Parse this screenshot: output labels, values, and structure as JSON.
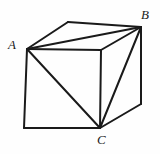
{
  "figure": {
    "type": "geometry-diagram",
    "background_color": "#fefefe",
    "stroke_color": "#1a1a1a",
    "labels": [
      {
        "id": "A",
        "text": "A",
        "vertex": "front-top-left",
        "x": 8,
        "y": 38
      },
      {
        "id": "B",
        "text": "B",
        "vertex": "back-top-right",
        "x": 141,
        "y": 8
      },
      {
        "id": "C",
        "text": "C",
        "vertex": "front-bottom-right",
        "x": 97,
        "y": 133
      }
    ],
    "vertices": {
      "A": {
        "x": 27,
        "y": 49
      },
      "B": {
        "x": 141,
        "y": 27
      },
      "C": {
        "x": 100,
        "y": 128
      },
      "top_back_left": {
        "x": 68,
        "y": 22
      },
      "front_top_right": {
        "x": 101,
        "y": 50
      },
      "front_bottom_left": {
        "x": 24,
        "y": 128
      },
      "right_bottom_back": {
        "x": 141,
        "y": 104
      }
    },
    "edges": [
      {
        "name": "front-face-top",
        "from": "A",
        "to": "front_top_right",
        "style": "solid",
        "width": 2
      },
      {
        "name": "front-face-left",
        "from": "A",
        "to": "front_bottom_left",
        "style": "solid",
        "width": 2
      },
      {
        "name": "front-face-bottom",
        "from": "front_bottom_left",
        "to": "C",
        "style": "solid",
        "width": 2
      },
      {
        "name": "front-face-right",
        "from": "front_top_right",
        "to": "C",
        "style": "solid",
        "width": 2
      },
      {
        "name": "top-face-back-left",
        "from": "A",
        "to": "top_back_left",
        "style": "solid",
        "width": 2
      },
      {
        "name": "top-face-back",
        "from": "top_back_left",
        "to": "B",
        "style": "solid",
        "width": 2
      },
      {
        "name": "top-face-right",
        "from": "B",
        "to": "front_top_right",
        "style": "solid",
        "width": 2
      },
      {
        "name": "right-face-vertical",
        "from": "B",
        "to": "right_bottom_back",
        "style": "solid",
        "width": 2
      },
      {
        "name": "right-face-bottom",
        "from": "right_bottom_back",
        "to": "C",
        "style": "solid",
        "width": 2
      }
    ],
    "triangle_edges": [
      {
        "name": "diagonal-AB-top-face",
        "from": "A",
        "to": "B",
        "style": "solid",
        "width": 2
      },
      {
        "name": "diagonal-AC-front-face",
        "from": "A",
        "to": "C",
        "style": "solid",
        "width": 2
      },
      {
        "name": "diagonal-BC-right-face",
        "from": "B",
        "to": "C",
        "style": "solid",
        "width": 2
      }
    ]
  }
}
